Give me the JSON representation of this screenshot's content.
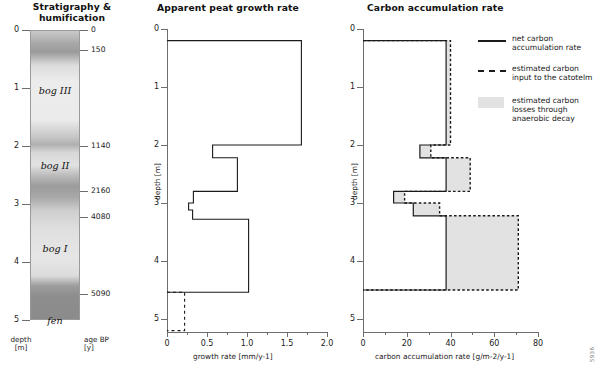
{
  "figure": {
    "corner_id": "5936"
  },
  "panels": {
    "stratigraphy": {
      "title": "Stratigraphy &\nhumification",
      "depth_axis_label": "depth\n[m]",
      "age_axis_label": "age BP\n[y]",
      "depth_ticks": [
        0,
        1,
        2,
        3,
        4,
        5
      ],
      "age_ticks": [
        {
          "value": "0",
          "depth": 0.0
        },
        {
          "value": "150",
          "depth": 0.35
        },
        {
          "value": "1140",
          "depth": 2.0
        },
        {
          "value": "2160",
          "depth": 2.78
        },
        {
          "value": "4080",
          "depth": 3.22
        },
        {
          "value": "5090",
          "depth": 4.55
        }
      ],
      "units": [
        {
          "label": "bog III",
          "depth": 1.05
        },
        {
          "label": "bog II",
          "depth": 2.35
        },
        {
          "label": "bog I",
          "depth": 3.78
        },
        {
          "label": "fen",
          "depth": 5.02
        }
      ],
      "humification_profile": [
        {
          "depth": 0.0,
          "shade": "#c9c9c9"
        },
        {
          "depth": 0.22,
          "shade": "#a9a9a9"
        },
        {
          "depth": 0.38,
          "shade": "#9a9a9a"
        },
        {
          "depth": 0.62,
          "shade": "#dcdcdc"
        },
        {
          "depth": 0.9,
          "shade": "#ececec"
        },
        {
          "depth": 1.6,
          "shade": "#ebebeb"
        },
        {
          "depth": 1.93,
          "shade": "#c4c4c4"
        },
        {
          "depth": 2.05,
          "shade": "#b0b0b0"
        },
        {
          "depth": 2.2,
          "shade": "#d8d8d8"
        },
        {
          "depth": 2.42,
          "shade": "#e2e2e2"
        },
        {
          "depth": 2.62,
          "shade": "#b9b9b9"
        },
        {
          "depth": 2.8,
          "shade": "#9c9c9c"
        },
        {
          "depth": 3.0,
          "shade": "#a8a8a8"
        },
        {
          "depth": 3.25,
          "shade": "#cfcfcf"
        },
        {
          "depth": 3.6,
          "shade": "#e0e0e0"
        },
        {
          "depth": 4.1,
          "shade": "#e6e6e6"
        },
        {
          "depth": 4.42,
          "shade": "#dcdcdc"
        },
        {
          "depth": 4.6,
          "shade": "#9d9d9d"
        },
        {
          "depth": 4.78,
          "shade": "#8e8e8e"
        },
        {
          "depth": 5.2,
          "shade": "#8b8b8b"
        }
      ]
    },
    "growth": {
      "title": "Apparent peat growth rate",
      "ylabel": "depth [m]",
      "xlabel": "growth rate [mm/y-1]",
      "xticks": [
        "0",
        "0.5",
        "1.0",
        "1.5",
        "2.0"
      ],
      "yticks": [
        "0",
        "1",
        "2",
        "3",
        "4",
        "5"
      ]
    },
    "carbon": {
      "title": "Carbon accumulation rate",
      "ylabel": "depth [m]",
      "xlabel": "carbon accumulation rate [g/m-2/y-1]",
      "xticks": [
        "0",
        "20",
        "40",
        "60",
        "80"
      ],
      "yticks": [
        "0",
        "1",
        "2",
        "3",
        "4",
        "5"
      ],
      "legend": [
        {
          "key": "net-line",
          "symbol": "solid-line",
          "label": "net carbon\naccumulation rate"
        },
        {
          "key": "input-line",
          "symbol": "dashed-line",
          "label": "estimated carbon\ninput to the catotelm"
        },
        {
          "key": "loss-area",
          "symbol": "grey-swatch",
          "label": "estimated carbon\nlosses through\nanaerobic decay"
        }
      ],
      "colors": {
        "line": "#1a1a1a",
        "fill": "#e2e2e2",
        "axis": "#6d6d6d"
      }
    }
  },
  "chart_data": [
    {
      "type": "line",
      "id": "apparent-peat-growth-rate",
      "title": "Apparent peat growth rate",
      "xlabel": "growth rate [mm/y-1]",
      "ylabel": "depth [m]",
      "xlim": [
        0,
        2.0
      ],
      "ylim": [
        0,
        5.4
      ],
      "y_inverted": true,
      "grid": false,
      "series": [
        {
          "name": "apparent peat growth rate",
          "style": "solid",
          "steps": [
            {
              "depth_top": 0.2,
              "depth_bottom": 2.0,
              "rate": 1.68
            },
            {
              "depth_top": 2.0,
              "depth_bottom": 2.22,
              "rate": 0.57
            },
            {
              "depth_top": 2.22,
              "depth_bottom": 2.8,
              "rate": 0.88
            },
            {
              "depth_top": 2.8,
              "depth_bottom": 3.0,
              "rate": 0.33
            },
            {
              "depth_top": 3.0,
              "depth_bottom": 3.12,
              "rate": 0.27
            },
            {
              "depth_top": 3.12,
              "depth_bottom": 3.28,
              "rate": 0.32
            },
            {
              "depth_top": 3.28,
              "depth_bottom": 4.54,
              "rate": 1.02
            }
          ]
        },
        {
          "name": "extrapolated growth rate",
          "style": "dashed",
          "steps": [
            {
              "depth_top": 4.54,
              "depth_bottom": 5.2,
              "rate": 0.22
            }
          ]
        }
      ]
    },
    {
      "type": "line",
      "id": "carbon-accumulation-rate",
      "title": "Carbon accumulation rate",
      "xlabel": "carbon accumulation rate [g/m-2/y-1]",
      "ylabel": "depth [m]",
      "xlim": [
        0,
        80
      ],
      "ylim": [
        0,
        5.4
      ],
      "y_inverted": true,
      "grid": false,
      "series": [
        {
          "name": "net carbon accumulation rate",
          "style": "solid",
          "steps": [
            {
              "depth_top": 0.2,
              "depth_bottom": 2.0,
              "rate": 38
            },
            {
              "depth_top": 2.0,
              "depth_bottom": 2.22,
              "rate": 26
            },
            {
              "depth_top": 2.22,
              "depth_bottom": 2.8,
              "rate": 38
            },
            {
              "depth_top": 2.8,
              "depth_bottom": 3.0,
              "rate": 14
            },
            {
              "depth_top": 3.0,
              "depth_bottom": 3.22,
              "rate": 23
            },
            {
              "depth_top": 3.22,
              "depth_bottom": 4.5,
              "rate": 38
            }
          ]
        },
        {
          "name": "estimated carbon input to the catotelm",
          "style": "dashed",
          "steps": [
            {
              "depth_top": 0.2,
              "depth_bottom": 2.0,
              "rate": 40
            },
            {
              "depth_top": 2.0,
              "depth_bottom": 2.22,
              "rate": 31
            },
            {
              "depth_top": 2.22,
              "depth_bottom": 2.8,
              "rate": 49
            },
            {
              "depth_top": 2.8,
              "depth_bottom": 3.0,
              "rate": 19
            },
            {
              "depth_top": 3.0,
              "depth_bottom": 3.22,
              "rate": 35
            },
            {
              "depth_top": 3.22,
              "depth_bottom": 4.5,
              "rate": 71
            }
          ]
        }
      ],
      "shaded_between": {
        "name": "estimated carbon losses through anaerobic decay",
        "fill": "#e2e2e2"
      }
    }
  ]
}
